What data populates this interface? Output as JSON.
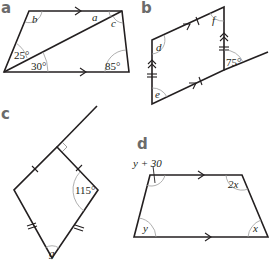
{
  "figures": {
    "a": {
      "label": "a",
      "angles": {
        "b": "b",
        "a": "a",
        "c": "c",
        "angle_25": "25°",
        "angle_30": "30°",
        "angle_85": "85°"
      }
    },
    "b": {
      "label": "b",
      "angles": {
        "d": "d",
        "f": "f",
        "e": "e",
        "angle_75": "75°"
      }
    },
    "c": {
      "label": "c",
      "angles": {
        "angle_115": "115°",
        "g": "g"
      }
    },
    "d": {
      "label": "d",
      "angles": {
        "y_plus_30": "y + 30",
        "two_x": "2x",
        "y": "y",
        "x": "x"
      }
    }
  },
  "colors": {
    "line": "#231f20",
    "arc": "#9a9a9a",
    "label": "#6b6b6b"
  }
}
